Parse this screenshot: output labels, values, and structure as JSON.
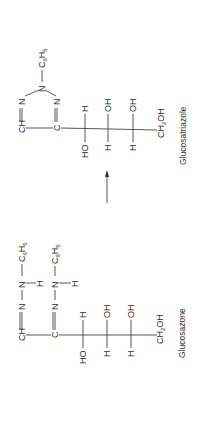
{
  "diagram": {
    "orientation": "rotated -90deg (text reads bottom-to-top)",
    "arrow": {
      "direction": "from glucosazone to glucosatriazole"
    },
    "glucosatriazole": {
      "label": "Glucosatriazole",
      "ring": {
        "ch": "CH",
        "n_top": "N",
        "n_apex": "N",
        "substituent_c": "C",
        "substituent_6": "6",
        "substituent_h": "H",
        "substituent_5": "5",
        "c": "C",
        "n_lower": "N"
      },
      "chain": [
        {
          "left": "HO",
          "right": "H"
        },
        {
          "left": "H",
          "right": "OH"
        },
        {
          "left": "H",
          "right": "OH"
        }
      ],
      "terminal": {
        "ch": "CH",
        "sub": "2",
        "oh": "OH"
      }
    },
    "glucosazone": {
      "label": "Glucosazone",
      "row1": {
        "ch": "CH",
        "n1": "N",
        "n2": "N",
        "h": "H",
        "c": "C",
        "c6": "6",
        "h2": "H",
        "h5": "5"
      },
      "row2": {
        "c": "C",
        "n1": "N",
        "n2": "N",
        "h": "H",
        "c_sub": "C",
        "c6": "6",
        "h2": "H",
        "h5": "5"
      },
      "chain": [
        {
          "left": "HO",
          "right": "H"
        },
        {
          "left": "H",
          "right": "OH"
        },
        {
          "left": "H",
          "right": "OH"
        }
      ],
      "terminal": {
        "ch": "CH",
        "sub": "2",
        "oh": "OH"
      }
    }
  }
}
